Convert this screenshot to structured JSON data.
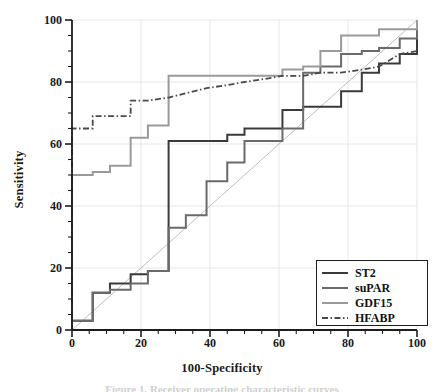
{
  "chart_data": {
    "type": "line",
    "title": "",
    "xlabel": "100-Specificity",
    "ylabel": "Sensitivity",
    "xlim": [
      0,
      100
    ],
    "ylim": [
      0,
      100
    ],
    "xticks": [
      0,
      20,
      40,
      60,
      80,
      100
    ],
    "yticks": [
      0,
      20,
      40,
      60,
      80,
      100
    ],
    "minor_tick_step": 5,
    "grid": true,
    "legend_position": "lower right",
    "reference_line": {
      "name": "chance-diagonal",
      "points": [
        [
          0,
          0
        ],
        [
          100,
          100
        ]
      ],
      "style": "thin-solid",
      "color": "#b7b7b7"
    },
    "series": [
      {
        "name": "ST2",
        "color": "#3a3a3a",
        "style": "solid",
        "width": 2.0,
        "points": [
          [
            0,
            0
          ],
          [
            0,
            3
          ],
          [
            6,
            3
          ],
          [
            6,
            12
          ],
          [
            11,
            12
          ],
          [
            11,
            15
          ],
          [
            17,
            15
          ],
          [
            17,
            18
          ],
          [
            22,
            18
          ],
          [
            22,
            19
          ],
          [
            28,
            19
          ],
          [
            28,
            61
          ],
          [
            33,
            61
          ],
          [
            33,
            61
          ],
          [
            45,
            61
          ],
          [
            45,
            63
          ],
          [
            50,
            63
          ],
          [
            50,
            65
          ],
          [
            61,
            65
          ],
          [
            61,
            71
          ],
          [
            67,
            71
          ],
          [
            67,
            72
          ],
          [
            78,
            72
          ],
          [
            78,
            77
          ],
          [
            84,
            77
          ],
          [
            84,
            83
          ],
          [
            89,
            83
          ],
          [
            89,
            86
          ],
          [
            95,
            86
          ],
          [
            95,
            89
          ],
          [
            100,
            89
          ],
          [
            100,
            100
          ]
        ]
      },
      {
        "name": "suPAR",
        "color": "#6a6a6a",
        "style": "solid",
        "width": 2.0,
        "points": [
          [
            0,
            0
          ],
          [
            0,
            3
          ],
          [
            6,
            3
          ],
          [
            6,
            12
          ],
          [
            11,
            12
          ],
          [
            11,
            13
          ],
          [
            17,
            13
          ],
          [
            17,
            15
          ],
          [
            22,
            15
          ],
          [
            22,
            19
          ],
          [
            28,
            19
          ],
          [
            28,
            25
          ],
          [
            28,
            33
          ],
          [
            33,
            33
          ],
          [
            33,
            37
          ],
          [
            39,
            37
          ],
          [
            39,
            48
          ],
          [
            45,
            48
          ],
          [
            45,
            54
          ],
          [
            50,
            54
          ],
          [
            50,
            61
          ],
          [
            56,
            61
          ],
          [
            61,
            61
          ],
          [
            61,
            65
          ],
          [
            67,
            65
          ],
          [
            67,
            83
          ],
          [
            72,
            83
          ],
          [
            72,
            85
          ],
          [
            78,
            85
          ],
          [
            78,
            89
          ],
          [
            84,
            89
          ],
          [
            84,
            90
          ],
          [
            89,
            90
          ],
          [
            89,
            91
          ],
          [
            95,
            91
          ],
          [
            95,
            94
          ],
          [
            100,
            94
          ],
          [
            100,
            100
          ]
        ]
      },
      {
        "name": "GDF15",
        "color": "#9a9a9a",
        "style": "solid",
        "width": 2.0,
        "points": [
          [
            0,
            0
          ],
          [
            0,
            50
          ],
          [
            6,
            50
          ],
          [
            6,
            51
          ],
          [
            11,
            51
          ],
          [
            11,
            53
          ],
          [
            17,
            53
          ],
          [
            17,
            62
          ],
          [
            22,
            62
          ],
          [
            22,
            66
          ],
          [
            28,
            66
          ],
          [
            28,
            82
          ],
          [
            50,
            82
          ],
          [
            50,
            82
          ],
          [
            56,
            82
          ],
          [
            61,
            82
          ],
          [
            61,
            84
          ],
          [
            67,
            84
          ],
          [
            67,
            85
          ],
          [
            72,
            85
          ],
          [
            72,
            90
          ],
          [
            78,
            90
          ],
          [
            78,
            95
          ],
          [
            89,
            95
          ],
          [
            89,
            97
          ],
          [
            100,
            97
          ],
          [
            100,
            100
          ]
        ]
      },
      {
        "name": "HFABP",
        "color": "#4a4a4a",
        "style": "dash-dot",
        "width": 1.8,
        "points": [
          [
            0,
            0
          ],
          [
            0,
            65
          ],
          [
            6,
            65
          ],
          [
            6,
            69
          ],
          [
            17,
            69
          ],
          [
            17,
            74
          ],
          [
            22,
            74
          ],
          [
            28,
            75
          ],
          [
            39,
            78
          ],
          [
            45,
            79
          ],
          [
            50,
            80
          ],
          [
            56,
            81
          ],
          [
            61,
            82
          ],
          [
            67,
            82
          ],
          [
            72,
            83
          ],
          [
            78,
            83
          ],
          [
            84,
            84
          ],
          [
            89,
            85
          ],
          [
            95,
            89
          ],
          [
            100,
            90
          ],
          [
            100,
            91
          ]
        ]
      }
    ]
  },
  "legend": {
    "entries": [
      {
        "label": "ST2",
        "color": "#3a3a3a",
        "style": "solid"
      },
      {
        "label": "suPAR",
        "color": "#6a6a6a",
        "style": "solid"
      },
      {
        "label": "GDF15",
        "color": "#9a9a9a",
        "style": "solid"
      },
      {
        "label": "HFABP",
        "color": "#4a4a4a",
        "style": "dash-dot"
      }
    ]
  },
  "axes": {
    "x_title": "100-Specificity",
    "y_title": "Sensitivity",
    "x_tick_labels": [
      "0",
      "20",
      "40",
      "60",
      "80",
      "100"
    ],
    "y_tick_labels": [
      "0",
      "20",
      "40",
      "60",
      "80",
      "100"
    ]
  },
  "caption": "Figure 1. Receiver operating characteristic curves",
  "colors": {
    "axis": "#1d1d1d",
    "grid": "#e3e3e3",
    "background": "#ffffff",
    "diagonal": "#b7b7b7"
  }
}
